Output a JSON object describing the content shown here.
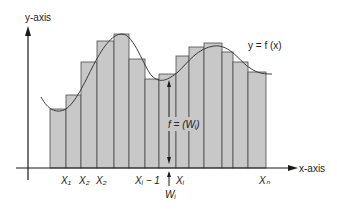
{
  "diagram": {
    "y_axis_label": "y-axis",
    "x_axis_label": "x-axis",
    "curve_label": "y = f (x)",
    "height_label": "f = (Wᵢ)",
    "width_marker_label": "Wᵢ",
    "x_tick_labels": [
      {
        "text": "X₁",
        "x": 66
      },
      {
        "text": "X₂",
        "x": 84
      },
      {
        "text": "X₂",
        "x": 101
      },
      {
        "text": "Xᵢ − 1",
        "x": 140
      },
      {
        "text": "Xᵢ",
        "x": 181
      },
      {
        "text": "Xₙ",
        "x": 264
      }
    ],
    "colors": {
      "bar_fill": "#c8c8c8",
      "bar_stroke": "#4a4a4a",
      "axis": "#1a1a1a",
      "curve": "#3a3a3a"
    },
    "baseline_y": 168,
    "bars": [
      {
        "x0": 50,
        "x1": 66,
        "top": 109
      },
      {
        "x0": 66,
        "x1": 81,
        "top": 95
      },
      {
        "x0": 81,
        "x1": 97,
        "top": 62
      },
      {
        "x0": 97,
        "x1": 114,
        "top": 41
      },
      {
        "x0": 114,
        "x1": 129,
        "top": 34
      },
      {
        "x0": 129,
        "x1": 145,
        "top": 59
      },
      {
        "x0": 145,
        "x1": 159,
        "top": 79
      },
      {
        "x0": 159,
        "x1": 176,
        "top": 74
      },
      {
        "x0": 176,
        "x1": 189,
        "top": 56
      },
      {
        "x0": 189,
        "x1": 204,
        "top": 47
      },
      {
        "x0": 204,
        "x1": 222,
        "top": 43
      },
      {
        "x0": 222,
        "x1": 233,
        "top": 52
      },
      {
        "x0": 233,
        "x1": 248,
        "top": 62
      },
      {
        "x0": 248,
        "x1": 266,
        "top": 72
      }
    ]
  }
}
